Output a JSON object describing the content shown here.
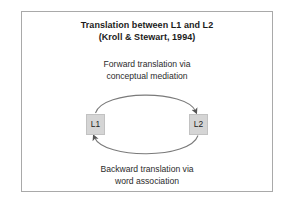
{
  "figure": {
    "background_color": "#ffffff",
    "frame_border_color": "#a9a9a9",
    "text_color": "#1b1b1b",
    "arrow_color": "#6e6e6e",
    "node_fill_color": "#d5d5d5",
    "node_border_color": "#c2c2c2"
  },
  "title": {
    "line1": "Translation between L1 and L2",
    "line2": "(Kroll & Stewart, 1994)"
  },
  "forward_caption": {
    "line1": "Forward translation via",
    "line2": "conceptual mediation"
  },
  "backward_caption": {
    "line1": "Backward translation via",
    "line2": "word association"
  },
  "nodes": [
    {
      "id": "l1",
      "label": "L1"
    },
    {
      "id": "l2",
      "label": "L2"
    }
  ],
  "arrows": [
    {
      "id": "forward-arrow",
      "from": "L1",
      "to": "L2",
      "direction": "clockwise-top",
      "label": "Forward translation via conceptual mediation"
    },
    {
      "id": "backward-arrow",
      "from": "L2",
      "to": "L1",
      "direction": "clockwise-bottom",
      "label": "Backward translation via word association"
    }
  ]
}
